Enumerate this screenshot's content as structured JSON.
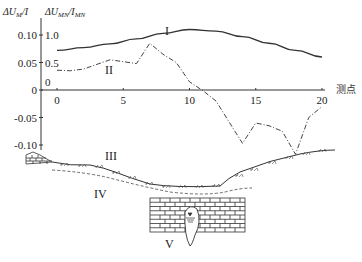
{
  "chart_data": {
    "type": "line",
    "title": "",
    "xlabel": "测点",
    "ylabel_left": "ΔU_M/I",
    "ylabel_right": "ΔU_MN/I_MN",
    "x_ticks": [
      0,
      5,
      10,
      15,
      20
    ],
    "y_left_ticks": [
      0.1,
      0.05,
      0,
      -0.05,
      -0.1
    ],
    "y_left_tick_labels": [
      "0.10",
      "0.05",
      "0",
      "-0.05",
      "-0.10"
    ],
    "y_right_tick_labels": [
      "1.0",
      "0.5",
      "0"
    ],
    "xlim": [
      0,
      20
    ],
    "ylim_left": [
      -0.1,
      0.1
    ],
    "ylim_right": [
      0,
      1.0
    ],
    "grid": false,
    "series": [
      {
        "name": "I",
        "style": "solid",
        "axis": "right",
        "x": [
          0,
          2,
          4,
          6,
          8,
          10,
          12,
          14,
          16,
          18,
          20
        ],
        "values": [
          0.72,
          0.77,
          0.84,
          0.93,
          1.03,
          1.1,
          1.07,
          0.97,
          0.85,
          0.72,
          0.6
        ]
      },
      {
        "name": "II",
        "style": "dash-dot",
        "axis": "left",
        "x": [
          0,
          1,
          2,
          4,
          6,
          7,
          8,
          9,
          10,
          11,
          12,
          14,
          15,
          16,
          17,
          18,
          19,
          20
        ],
        "values": [
          0.036,
          0.035,
          0.038,
          0.055,
          0.048,
          0.085,
          0.065,
          0.05,
          0.015,
          -0.001,
          -0.02,
          -0.097,
          -0.06,
          -0.065,
          -0.075,
          -0.117,
          -0.05,
          -0.03
        ]
      }
    ],
    "annotations": [
      "I",
      "II",
      "III",
      "IV",
      "V"
    ]
  },
  "labels": {
    "y_left_title": "ΔU",
    "y_left_sub": "M",
    "y_left_den": "/I",
    "y_right_title": "ΔU",
    "y_right_sub": "MN",
    "y_right_den": "/I",
    "y_right_den_sub": "MN",
    "x_axis_title": "测点",
    "curve_I": "I",
    "curve_II": "II",
    "layer_III": "III",
    "layer_IV": "IV",
    "cave_V": "V",
    "right_zero": "0"
  }
}
